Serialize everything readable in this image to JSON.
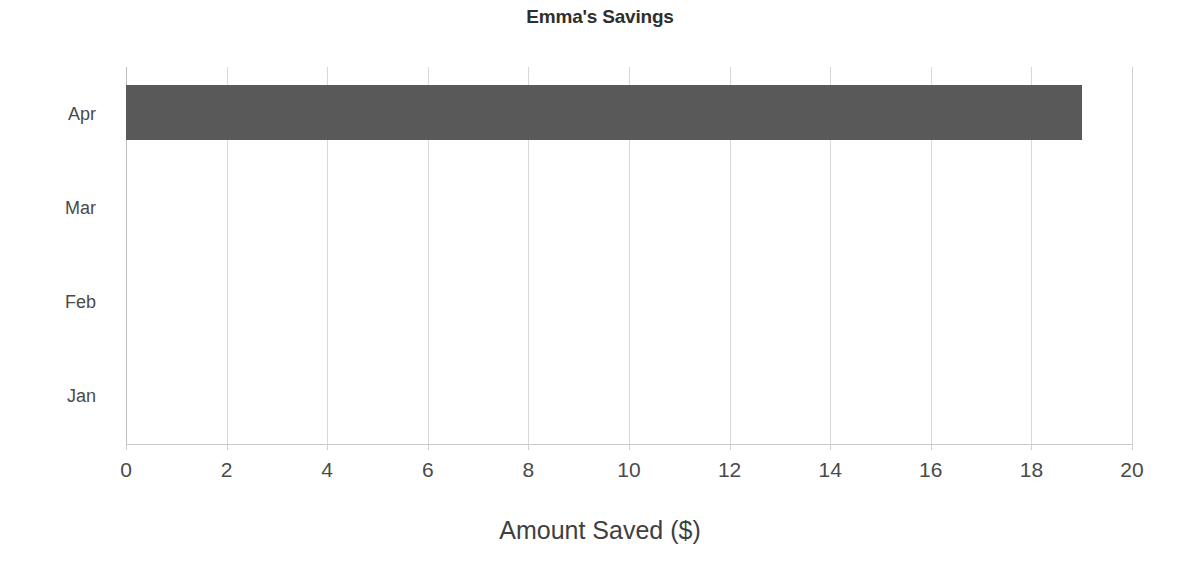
{
  "chart_data": {
    "type": "bar",
    "orientation": "horizontal",
    "title": "Emma's Savings",
    "xlabel": "Amount Saved ($)",
    "ylabel": "",
    "categories": [
      "Jan",
      "Feb",
      "Mar",
      "Apr"
    ],
    "values": [
      0,
      0,
      0,
      19
    ],
    "series": [
      {
        "name": "Amount Saved ($)",
        "values": [
          0,
          0,
          0,
          19
        ]
      }
    ],
    "xlim": [
      0,
      20
    ],
    "xticks": [
      0,
      2,
      4,
      6,
      8,
      10,
      12,
      14,
      16,
      18,
      20
    ],
    "xtick_labels": [
      "0",
      "2",
      "4",
      "6",
      "8",
      "10",
      "12",
      "14",
      "16",
      "18",
      "20"
    ],
    "grid": "vertical",
    "legend": "none",
    "bar_color": "#595959",
    "gridline_color": "#d9d9d9",
    "axis_color": "#bfbfbf",
    "background": "#ffffff",
    "display_order_top_to_bottom": [
      "Apr",
      "Mar",
      "Feb",
      "Jan"
    ]
  }
}
